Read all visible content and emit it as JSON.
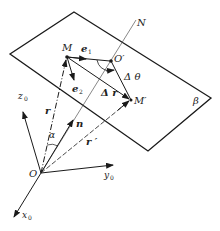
{
  "diagram": {
    "title": "",
    "colors": {
      "line": "#1a1a1a",
      "background": "#ffffff"
    },
    "labels": {
      "M": "M",
      "O_prime": "O′",
      "M_prime": "M′",
      "N": "N",
      "beta": "β",
      "e1": "e",
      "e1_sub": "1",
      "e2": "e",
      "e2_sub": "2",
      "delta_theta": "Δ θ",
      "delta_r": "Δ r",
      "r": "r",
      "r_prime": "r ′",
      "n": "n",
      "alpha": "α",
      "O": "O",
      "z0": "z",
      "z0_sub": "0",
      "y0": "y",
      "y0_sub": "0",
      "x0": "x",
      "x0_sub": "0"
    },
    "points": {
      "O": [
        41,
        173
      ],
      "M": [
        67,
        57
      ],
      "O_prime": [
        111,
        61
      ],
      "M_prime": [
        131,
        100
      ],
      "plane_top": [
        74,
        12
      ],
      "plane_left": [
        10,
        54
      ],
      "plane_right": [
        211,
        98
      ],
      "plane_bottom": [
        148,
        151
      ]
    }
  }
}
